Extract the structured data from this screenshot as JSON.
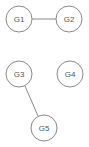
{
  "diagram": {
    "type": "graph",
    "nodes": [
      {
        "id": "G1",
        "label": "G1",
        "x": 19,
        "y": 19
      },
      {
        "id": "G2",
        "label": "G2",
        "x": 69,
        "y": 19
      },
      {
        "id": "G3",
        "label": "G3",
        "x": 19,
        "y": 74
      },
      {
        "id": "G4",
        "label": "G4",
        "x": 70,
        "y": 74
      },
      {
        "id": "G5",
        "label": "G5",
        "x": 44,
        "y": 128
      }
    ],
    "edges": [
      {
        "from": "G1",
        "to": "G2"
      },
      {
        "from": "G3",
        "to": "G5"
      }
    ],
    "colors": {
      "stroke": "#8a8a8a",
      "text": "#555555",
      "background": "#ffffff"
    }
  }
}
